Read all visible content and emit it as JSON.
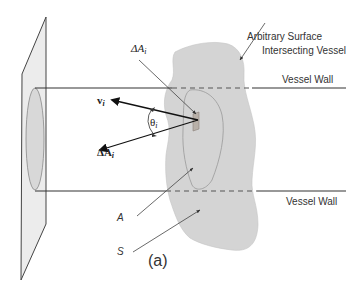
{
  "figure": {
    "panel_label": "(a)",
    "labels": {
      "surface_line1": "Arbitrary Surface",
      "surface_line2": "Intersecting Vessel",
      "vessel_wall_top": "Vessel Wall",
      "vessel_wall_bottom": "Vessel Wall",
      "delta_a_scalar": "ΔA",
      "delta_a_scalar_sub": "i",
      "velocity": "v",
      "velocity_sub": "i",
      "theta": "θ",
      "theta_sub": "i",
      "delta_a_vector": "ΔA",
      "delta_a_vector_sub": "i",
      "area_A": "A",
      "surface_S": "S"
    },
    "colors": {
      "surface_fill": "#d4d4d4",
      "plane_fill": "#ececec",
      "line": "#333333",
      "element_fill": "#b8b0a8"
    }
  }
}
